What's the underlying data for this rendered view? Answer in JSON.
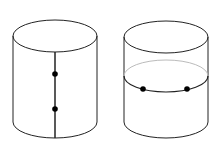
{
  "diagram": {
    "colors": {
      "stroke": "#222222",
      "hidden": "#bbbbbb",
      "point": "#000000",
      "background": "#ffffff"
    },
    "cylinders": [
      {
        "id": "left",
        "path": "vertical-line",
        "points": 2
      },
      {
        "id": "right",
        "path": "horizontal-circle",
        "points": 2
      }
    ]
  }
}
